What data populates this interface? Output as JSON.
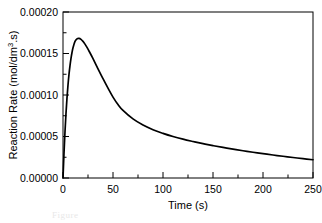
{
  "figure": {
    "background_color": "#ffffff",
    "line_color": "#000000"
  },
  "caption_stub": "Figure",
  "chart_data": {
    "type": "line",
    "title": "",
    "subtitle": "",
    "xlabel": "Time (s)",
    "ylabel": "Reaction Rate (mol/dm³.s)",
    "ylabel_parts": {
      "prefix": "Reaction Rate (mol/dm",
      "superscript": "3",
      "suffix": ".s)"
    },
    "xlim": [
      0,
      250
    ],
    "ylim": [
      0,
      0.0002
    ],
    "xticks": [
      0,
      50,
      100,
      150,
      200,
      250
    ],
    "xtick_labels": [
      "0",
      "50",
      "100",
      "150",
      "200",
      "250"
    ],
    "x_minor_ticks": [
      25,
      75,
      125,
      175,
      225
    ],
    "yticks": [
      0,
      5e-05,
      0.0001,
      0.00015,
      0.0002
    ],
    "ytick_labels": [
      "0.00000",
      "0.00005",
      "0.00010",
      "0.00015",
      "0.00020"
    ],
    "y_minor_ticks": [
      2.5e-05,
      7.5e-05,
      0.000125,
      0.000175
    ],
    "grid": false,
    "legend": null,
    "legend_position": "none",
    "series": [
      {
        "name": "Reaction Rate",
        "color": "#000000",
        "x": [
          0,
          1,
          2,
          3,
          4,
          5,
          6,
          7,
          8,
          9,
          10,
          12,
          14,
          16,
          18,
          20,
          22,
          24,
          26,
          28,
          30,
          35,
          40,
          45,
          50,
          55,
          60,
          70,
          80,
          90,
          100,
          110,
          120,
          130,
          140,
          150,
          160,
          170,
          180,
          190,
          200,
          210,
          220,
          230,
          240,
          250
        ],
        "y": [
          0.0,
          3e-05,
          5.6e-05,
          7.8e-05,
          9.65e-05,
          0.000112,
          0.000125,
          0.0001355,
          0.0001442,
          0.0001512,
          0.0001569,
          0.0001645,
          0.0001677,
          0.0001682,
          0.000167,
          0.0001646,
          0.0001613,
          0.0001574,
          0.000153,
          0.0001485,
          0.0001437,
          0.0001315,
          0.0001196,
          0.0001082,
          9.75e-05,
          8.85e-05,
          8.15e-05,
          7.12e-05,
          6.38e-05,
          5.82e-05,
          5.38e-05,
          5e-05,
          4.68e-05,
          4.4e-05,
          4.14e-05,
          3.9e-05,
          3.68e-05,
          3.47e-05,
          3.28e-05,
          3.1e-05,
          2.93e-05,
          2.77e-05,
          2.62e-05,
          2.47e-05,
          2.33e-05,
          2.2e-05
        ]
      }
    ],
    "peak": {
      "x": 26,
      "y": 0.000166
    },
    "annotations": []
  }
}
